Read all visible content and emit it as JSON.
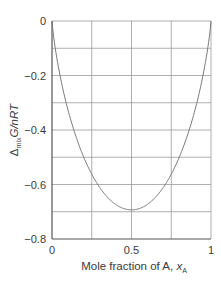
{
  "chart_data": {
    "type": "line",
    "title": "",
    "xlabel": "Mole fraction of A, x_A",
    "xlabel_parts": {
      "main": "Mole fraction of A, ",
      "var": "x",
      "sub": "A"
    },
    "ylabel": "Δmix G/nRT",
    "ylabel_parts": {
      "delta": "Δ",
      "sub": "mix",
      "rest": "G/nRT"
    },
    "xlim": [
      0,
      1
    ],
    "ylim": [
      -0.8,
      0
    ],
    "x_ticks": [
      0,
      0.5,
      1
    ],
    "x_tick_labels": [
      "0",
      "0.5",
      "1"
    ],
    "y_ticks": [
      0,
      -0.2,
      -0.4,
      -0.6,
      -0.8
    ],
    "y_tick_labels": [
      "0",
      "−0.2",
      "−0.4",
      "−0.6",
      "−0.8"
    ],
    "grid": true,
    "grid_x": [
      0.25,
      0.5,
      0.75,
      1
    ],
    "grid_y": [
      0,
      -0.1,
      -0.2,
      -0.3,
      -0.4,
      -0.5,
      -0.6,
      -0.7
    ],
    "legend": null,
    "series": [
      {
        "name": "Δmix G/nRT = xA ln xA + xB ln xB",
        "x": [
          0.0,
          0.01,
          0.05,
          0.1,
          0.15,
          0.2,
          0.25,
          0.3,
          0.35,
          0.4,
          0.45,
          0.5,
          0.55,
          0.6,
          0.65,
          0.7,
          0.75,
          0.8,
          0.85,
          0.9,
          0.95,
          0.99,
          1.0
        ],
        "y": [
          0.0,
          -0.056,
          -0.199,
          -0.325,
          -0.423,
          -0.5,
          -0.562,
          -0.611,
          -0.647,
          -0.673,
          -0.688,
          -0.693,
          -0.688,
          -0.673,
          -0.647,
          -0.611,
          -0.562,
          -0.5,
          -0.423,
          -0.325,
          -0.199,
          -0.056,
          0.0
        ]
      }
    ]
  },
  "colors": {
    "curve": "#7a7a7a",
    "grid": "#9a9a9a",
    "axis": "#555555",
    "text": "#3a3a3a"
  }
}
